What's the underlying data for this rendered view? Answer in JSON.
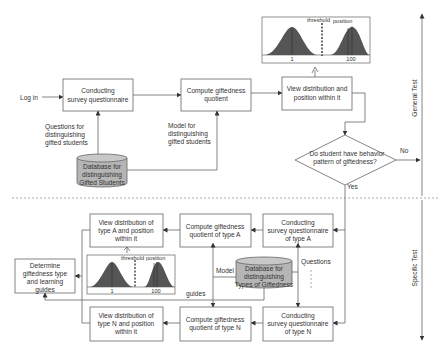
{
  "diagram": {
    "general": {
      "login": "Log in",
      "conduct_survey": [
        "Conducting",
        "survey questionnaire"
      ],
      "compute_quotient": [
        "Compute giftedness",
        "quotient"
      ],
      "view_distribution": [
        "View distribution and",
        "position within it"
      ],
      "questions_label": [
        "Questions for",
        "distinguishing",
        "gifted students"
      ],
      "model_label": [
        "Model for",
        "distinguishing",
        "gifted students"
      ],
      "database": [
        "Database for",
        "distinguishing",
        "Gifted Students"
      ],
      "decision": [
        "Do student have behavior",
        "pattern of giftedness?"
      ],
      "no_label": "No",
      "yes_label": "Yes",
      "chart": {
        "threshold": "threshold",
        "position": "position",
        "tick_left": "1",
        "tick_right": "100"
      }
    },
    "specific": {
      "conduct_a": [
        "Conducting",
        "survey questionnaire",
        "of type A"
      ],
      "compute_a": [
        "Compute giftedness",
        "quotient of type A"
      ],
      "view_a": [
        "View distribution of",
        "type A and position",
        "within it"
      ],
      "conduct_n": [
        "Conducting",
        "survey questionnaire",
        "of type N"
      ],
      "compute_n": [
        "Compute giftedness",
        "quotient of type N"
      ],
      "view_n": [
        "View distribution of",
        "type N and position",
        "within it"
      ],
      "determine": [
        "Determine",
        "giftedness type",
        "and learning",
        "guides"
      ],
      "database": [
        "Database for",
        "distinguishing",
        "Types of Giftedness"
      ],
      "model_label": "Model",
      "questions_label": "Questions",
      "guides_label": "guides",
      "chart": {
        "threshold": "threshold",
        "position": "position",
        "tick_left": "1",
        "tick_right": "100"
      }
    },
    "side_labels": {
      "general": "General Test",
      "specific": "Specific Test"
    },
    "colors": {
      "line": "#666666",
      "db_fill": "#b5b5b5",
      "curve_fill": "#555555"
    }
  }
}
